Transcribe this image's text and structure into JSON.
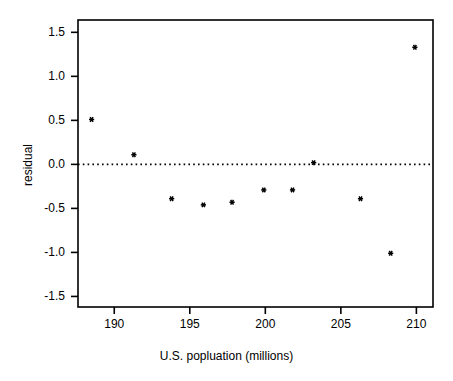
{
  "chart_data": {
    "type": "scatter",
    "title": "",
    "xlabel": "U.S. popluation (millions)",
    "ylabel": "residual",
    "xlim": [
      187.6,
      211.1
    ],
    "ylim": [
      -1.62,
      1.64
    ],
    "xticks": [
      190,
      195,
      200,
      205,
      210
    ],
    "xtick_labels": [
      "190",
      "195",
      "200",
      "205",
      "210"
    ],
    "yticks": [
      1.5,
      1.0,
      0.5,
      0.0,
      -0.5,
      -1.0,
      -1.5
    ],
    "ytick_labels": [
      "1.5",
      "1.0",
      "0.5",
      "0.0",
      "-0.5",
      "-1.0",
      "-1.5"
    ],
    "grid": false,
    "legend": null,
    "marker": "asterisk",
    "marker_color": "#000000",
    "reference_line": {
      "orientation": "horizontal",
      "y": 0.0,
      "style": "dotted",
      "color": "#000000"
    },
    "x": [
      188.5,
      191.3,
      193.8,
      195.9,
      197.8,
      199.9,
      201.8,
      203.2,
      206.3,
      208.3,
      209.9
    ],
    "y": [
      0.51,
      0.11,
      -0.39,
      -0.46,
      -0.43,
      -0.29,
      -0.29,
      0.02,
      -0.39,
      -1.01,
      1.33
    ],
    "points": [
      {
        "x": 188.5,
        "y": 0.51
      },
      {
        "x": 191.3,
        "y": 0.11
      },
      {
        "x": 193.8,
        "y": -0.39
      },
      {
        "x": 195.9,
        "y": -0.46
      },
      {
        "x": 197.8,
        "y": -0.43
      },
      {
        "x": 199.9,
        "y": -0.29
      },
      {
        "x": 201.8,
        "y": -0.29
      },
      {
        "x": 203.2,
        "y": 0.02
      },
      {
        "x": 206.3,
        "y": -0.39
      },
      {
        "x": 208.3,
        "y": -1.01
      },
      {
        "x": 209.9,
        "y": 1.33
      }
    ]
  },
  "colors": {
    "background": "#ffffff",
    "axis": "#000000",
    "marker": "#000000"
  }
}
